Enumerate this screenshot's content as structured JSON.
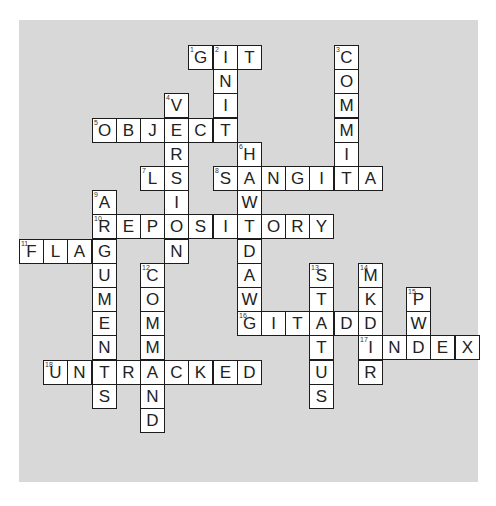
{
  "header": {
    "caption": ""
  },
  "puzzle": {
    "colors": {
      "board": "#d8d8d8",
      "cell": "#ffffff",
      "border": "#1c1c1c",
      "text": "#222222"
    },
    "grid": {
      "origin_x": 19,
      "origin_y": 45,
      "cell_size": 24.2,
      "cols": 19,
      "rows": 17
    },
    "words": [
      {
        "number": 1,
        "direction": "across",
        "answer": "GIT",
        "col": 7,
        "row": 0
      },
      {
        "number": 2,
        "direction": "down",
        "answer": "INIT",
        "col": 8,
        "row": 0
      },
      {
        "number": 3,
        "direction": "down",
        "answer": "COMMIT",
        "col": 13,
        "row": 0
      },
      {
        "number": 4,
        "direction": "down",
        "answer": "VERSION",
        "col": 6,
        "row": 2
      },
      {
        "number": 5,
        "direction": "across",
        "answer": "OBJECT",
        "col": 3,
        "row": 3
      },
      {
        "number": 6,
        "direction": "down",
        "answer": "HAWTDAWG",
        "col": 9,
        "row": 4
      },
      {
        "number": 7,
        "direction": "across",
        "answer": "LS",
        "col": 5,
        "row": 5
      },
      {
        "number": 8,
        "direction": "across",
        "answer": "SANGITA",
        "col": 8,
        "row": 5
      },
      {
        "number": 9,
        "direction": "down",
        "answer": "ARGUMENTS",
        "col": 3,
        "row": 6
      },
      {
        "number": 10,
        "direction": "across",
        "answer": "REPOSITORY",
        "col": 3,
        "row": 7
      },
      {
        "number": 11,
        "direction": "across",
        "answer": "FLAG",
        "col": 0,
        "row": 8
      },
      {
        "number": 12,
        "direction": "down",
        "answer": "COMMAND",
        "col": 5,
        "row": 9
      },
      {
        "number": 13,
        "direction": "down",
        "answer": "STATUS",
        "col": 12,
        "row": 9
      },
      {
        "number": 14,
        "direction": "down",
        "answer": "MKDIR",
        "col": 14,
        "row": 9
      },
      {
        "number": 15,
        "direction": "down",
        "answer": "PWD",
        "col": 16,
        "row": 10
      },
      {
        "number": 16,
        "direction": "across",
        "answer": "GITADD",
        "col": 9,
        "row": 11
      },
      {
        "number": 17,
        "direction": "across",
        "answer": "INDEX",
        "col": 14,
        "row": 12
      },
      {
        "number": 18,
        "direction": "across",
        "answer": "UNTRACKED",
        "col": 1,
        "row": 13
      }
    ]
  }
}
